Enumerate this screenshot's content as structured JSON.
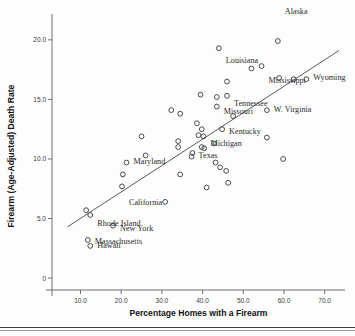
{
  "chart_data": {
    "type": "scatter",
    "title": "",
    "xlabel": "Percentage Homes with a Firearm",
    "ylabel": "Firearm (Age-Adjusted) Death Rate",
    "xlim": [
      3.0,
      75.0
    ],
    "ylim": [
      -1.0,
      21.5
    ],
    "xticks": [
      10.0,
      20.0,
      30.0,
      40.0,
      50.0,
      60.0,
      70.0
    ],
    "xticklabels": [
      "10.0",
      "20.0",
      "30.0",
      "40.0",
      "50.0",
      "60.0",
      "70.0"
    ],
    "yticks": [
      0.0,
      5.0,
      10.0,
      15.0,
      20.0
    ],
    "yticklabels": [
      "0",
      "5.0",
      "10.0",
      "15.0",
      "20.0"
    ],
    "grid": false,
    "legend": null,
    "marker": "open-circle",
    "fit_line": {
      "type": "linear-regression",
      "x_start": 6.8,
      "y_start": 4.3,
      "x_end": 73.5,
      "y_end": 19.1
    },
    "points": [
      {
        "label": "Alaska",
        "x": 58.5,
        "y": 19.9,
        "label_dx": 7,
        "label_dy": 2.5
      },
      {
        "label": "Louisiana",
        "x": 44.0,
        "y": 19.3,
        "label_dx": 7,
        "label_dy": -1.0
      },
      {
        "label": "Mississippi",
        "x": 54.5,
        "y": 17.8,
        "label_dx": 7,
        "label_dy": -1.2
      },
      {
        "label": "Wyoming",
        "x": 65.5,
        "y": 16.7,
        "label_dx": 7,
        "label_dy": 0.2
      },
      {
        "label": "Tennessee",
        "x": 46.0,
        "y": 15.3,
        "label_dx": 7,
        "label_dy": -0.6
      },
      {
        "label": "Missouri",
        "x": 43.5,
        "y": 14.4,
        "label_dx": 7,
        "label_dy": -0.4
      },
      {
        "label": "W. Virginia",
        "x": 55.8,
        "y": 14.1,
        "label_dx": 7,
        "label_dy": 0.1
      },
      {
        "label": "Kentucky",
        "x": 44.8,
        "y": 12.5,
        "label_dx": 7,
        "label_dy": -0.2
      },
      {
        "label": "Michigan",
        "x": 40.2,
        "y": 11.9,
        "label_dx": 7,
        "label_dy": -0.6
      },
      {
        "label": "Texas",
        "x": 37.3,
        "y": 10.2,
        "label_dx": 7,
        "label_dy": 0.1
      },
      {
        "label": "Maryland",
        "x": 21.3,
        "y": 9.7,
        "label_dx": 7,
        "label_dy": 0.1
      },
      {
        "label": "California",
        "x": 20.2,
        "y": 7.7,
        "label_dx": 7,
        "label_dy": -1.3
      },
      {
        "label": "Rhode Island",
        "x": 12.4,
        "y": 5.3,
        "label_dx": 7,
        "label_dy": -0.7
      },
      {
        "label": "New York",
        "x": 18.0,
        "y": 4.4,
        "label_dx": 7,
        "label_dy": -0.2
      },
      {
        "label": "Massachusetts",
        "x": 11.8,
        "y": 3.2,
        "label_dx": 7,
        "label_dy": -0.1
      },
      {
        "label": "Hawaii",
        "x": 12.4,
        "y": 2.7,
        "label_dx": 7,
        "label_dy": 0.1
      },
      {
        "label": "",
        "x": 52.0,
        "y": 17.6
      },
      {
        "label": "",
        "x": 58.8,
        "y": 16.8
      },
      {
        "label": "",
        "x": 62.4,
        "y": 16.7
      },
      {
        "label": "",
        "x": 46.0,
        "y": 16.5
      },
      {
        "label": "",
        "x": 39.5,
        "y": 15.4
      },
      {
        "label": "",
        "x": 43.5,
        "y": 15.2
      },
      {
        "label": "",
        "x": 32.3,
        "y": 14.1
      },
      {
        "label": "",
        "x": 34.5,
        "y": 13.8
      },
      {
        "label": "",
        "x": 47.5,
        "y": 13.6
      },
      {
        "label": "",
        "x": 38.6,
        "y": 13.0
      },
      {
        "label": "",
        "x": 39.8,
        "y": 12.5
      },
      {
        "label": "",
        "x": 25.0,
        "y": 11.9
      },
      {
        "label": "",
        "x": 55.8,
        "y": 11.8
      },
      {
        "label": "",
        "x": 39.0,
        "y": 12.0
      },
      {
        "label": "",
        "x": 42.8,
        "y": 11.3
      },
      {
        "label": "",
        "x": 34.0,
        "y": 11.5
      },
      {
        "label": "",
        "x": 34.0,
        "y": 11.0
      },
      {
        "label": "",
        "x": 39.8,
        "y": 11.0
      },
      {
        "label": "",
        "x": 40.4,
        "y": 10.9
      },
      {
        "label": "",
        "x": 37.5,
        "y": 10.5
      },
      {
        "label": "",
        "x": 26.0,
        "y": 10.3
      },
      {
        "label": "",
        "x": 59.8,
        "y": 10.0
      },
      {
        "label": "",
        "x": 43.2,
        "y": 9.7
      },
      {
        "label": "",
        "x": 44.3,
        "y": 9.3
      },
      {
        "label": "",
        "x": 45.8,
        "y": 9.0
      },
      {
        "label": "",
        "x": 34.5,
        "y": 8.7
      },
      {
        "label": "",
        "x": 20.4,
        "y": 8.7
      },
      {
        "label": "",
        "x": 46.3,
        "y": 8.0
      },
      {
        "label": "",
        "x": 41.0,
        "y": 7.6
      },
      {
        "label": "",
        "x": 30.8,
        "y": 6.4
      },
      {
        "label": "",
        "x": 11.4,
        "y": 5.7
      }
    ]
  }
}
